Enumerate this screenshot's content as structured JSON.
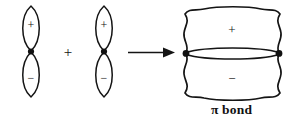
{
  "figure": {
    "kind": "orbital-overlap-diagram",
    "caption": "π bond",
    "operator": "+",
    "arrow": "→",
    "stroke_color": "#141414",
    "background_color": "#ffffff",
    "orbitals": [
      {
        "name": "p-orbital-left",
        "top_lobe_sign": "+",
        "bottom_lobe_sign": "−",
        "node_marker": "dot"
      },
      {
        "name": "p-orbital-right",
        "top_lobe_sign": "+",
        "bottom_lobe_sign": "−",
        "node_marker": "dot"
      }
    ],
    "product": {
      "name": "pi-molecular-orbital",
      "top_lobe_sign": "+",
      "bottom_lobe_sign": "−",
      "node_markers": [
        "dot",
        "dot"
      ],
      "label": "π bond"
    }
  }
}
